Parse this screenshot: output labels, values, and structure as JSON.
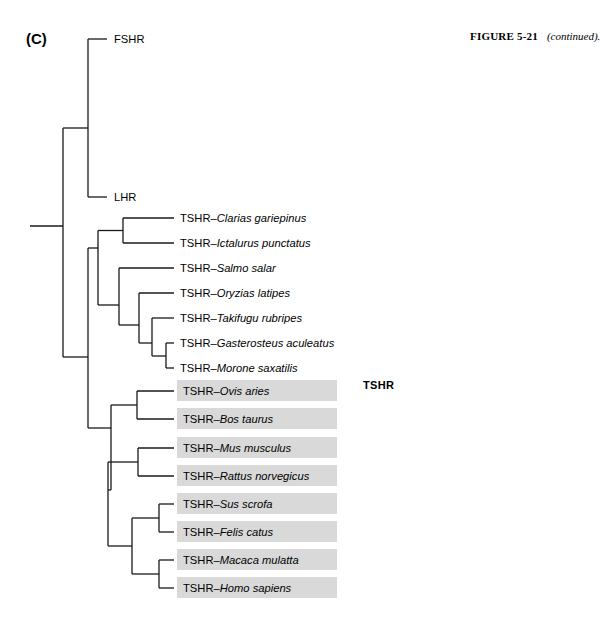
{
  "figure": {
    "panel_letter": "(C)",
    "caption_label": "FIGURE 5-21",
    "caption_note": "(continued).",
    "clade_label": "TSHR",
    "highlight_color": "#d9d9d9",
    "line_color": "#1a1a1a",
    "background_color": "#ffffff"
  },
  "tree": {
    "type": "cladogram",
    "orientation": "left-to-right",
    "root_x": 30,
    "leaves": [
      {
        "index": 0,
        "prefix": "",
        "separator": "",
        "species": "FSHR",
        "full_label": "FSHR",
        "italic_species": false,
        "highlighted": false,
        "tip_x": 107,
        "y": 39,
        "label_x": 114
      },
      {
        "index": 1,
        "prefix": "",
        "separator": "",
        "species": "LHR",
        "full_label": "LHR",
        "italic_species": false,
        "highlighted": false,
        "tip_x": 107,
        "y": 197,
        "label_x": 114
      },
      {
        "index": 2,
        "prefix": "TSHR",
        "separator": "–",
        "species": "Clarias gariepinus",
        "full_label": "TSHR–Clarias gariepinus",
        "italic_species": true,
        "highlighted": false,
        "tip_x": 174,
        "y": 218,
        "label_x": 180
      },
      {
        "index": 3,
        "prefix": "TSHR",
        "separator": "–",
        "species": "Ictalurus punctatus",
        "full_label": "TSHR–Ictalurus punctatus",
        "italic_species": true,
        "highlighted": false,
        "tip_x": 174,
        "y": 243,
        "label_x": 180
      },
      {
        "index": 4,
        "prefix": "TSHR",
        "separator": "–",
        "species": "Salmo salar",
        "full_label": "TSHR–Salmo salar",
        "italic_species": true,
        "highlighted": false,
        "tip_x": 174,
        "y": 268,
        "label_x": 180
      },
      {
        "index": 5,
        "prefix": "TSHR",
        "separator": "–",
        "species": "Oryzias latipes",
        "full_label": "TSHR–Oryzias latipes",
        "italic_species": true,
        "highlighted": false,
        "tip_x": 174,
        "y": 293,
        "label_x": 180
      },
      {
        "index": 6,
        "prefix": "TSHR",
        "separator": "–",
        "species": "Takifugu rubripes",
        "full_label": "TSHR–Takifugu rubripes",
        "italic_species": true,
        "highlighted": false,
        "tip_x": 174,
        "y": 318,
        "label_x": 180
      },
      {
        "index": 7,
        "prefix": "TSHR",
        "separator": "–",
        "species": "Gasterosteus aculeatus",
        "full_label": "TSHR–Gasterosteus aculeatus",
        "italic_species": true,
        "highlighted": false,
        "tip_x": 174,
        "y": 343,
        "label_x": 180
      },
      {
        "index": 8,
        "prefix": "TSHR",
        "separator": "–",
        "species": "Morone saxatilis",
        "full_label": "TSHR–Morone saxatilis",
        "italic_species": true,
        "highlighted": false,
        "tip_x": 174,
        "y": 368,
        "label_x": 180
      },
      {
        "index": 9,
        "prefix": "TSHR",
        "separator": "–",
        "species": "Ovis aries",
        "full_label": "TSHR–Ovis aries",
        "italic_species": true,
        "highlighted": true,
        "tip_x": 174,
        "y": 391,
        "label_x": 183
      },
      {
        "index": 10,
        "prefix": "TSHR",
        "separator": "–",
        "species": "Bos taurus",
        "full_label": "TSHR–Bos taurus",
        "italic_species": true,
        "highlighted": true,
        "tip_x": 174,
        "y": 419,
        "label_x": 183
      },
      {
        "index": 11,
        "prefix": "TSHR",
        "separator": "–",
        "species": "Mus musculus",
        "full_label": "TSHR–Mus musculus",
        "italic_species": true,
        "highlighted": true,
        "tip_x": 174,
        "y": 448,
        "label_x": 183
      },
      {
        "index": 12,
        "prefix": "TSHR",
        "separator": "–",
        "species": "Rattus norvegicus",
        "full_label": "TSHR–Rattus norvegicus",
        "italic_species": true,
        "highlighted": true,
        "tip_x": 174,
        "y": 476,
        "label_x": 183
      },
      {
        "index": 13,
        "prefix": "TSHR",
        "separator": "–",
        "species": "Sus scrofa",
        "full_label": "TSHR–Sus scrofa",
        "italic_species": true,
        "highlighted": true,
        "tip_x": 174,
        "y": 504,
        "label_x": 183
      },
      {
        "index": 14,
        "prefix": "TSHR",
        "separator": "–",
        "species": "Felis catus",
        "full_label": "TSHR–Felis catus",
        "italic_species": true,
        "highlighted": true,
        "tip_x": 174,
        "y": 532,
        "label_x": 183
      },
      {
        "index": 15,
        "prefix": "TSHR",
        "separator": "–",
        "species": "Macaca mulatta",
        "full_label": "TSHR–Macaca mulatta",
        "italic_species": true,
        "highlighted": true,
        "tip_x": 174,
        "y": 560,
        "label_x": 183
      },
      {
        "index": 16,
        "prefix": "TSHR",
        "separator": "–",
        "species": "Homo sapiens",
        "full_label": "TSHR–Homo sapiens",
        "italic_species": true,
        "highlighted": true,
        "tip_x": 174,
        "y": 588,
        "label_x": 183
      }
    ],
    "highlight_bars": {
      "x": 177,
      "width": 160,
      "height": 21,
      "leaf_indices": [
        9,
        10,
        11,
        12,
        13,
        14,
        15,
        16
      ]
    }
  }
}
